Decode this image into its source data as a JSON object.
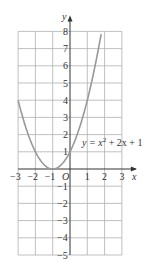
{
  "chart_data": {
    "type": "line",
    "title": "",
    "equation_label": "y = x² + 2x + 1",
    "equation_parts": {
      "lhs": "y = x",
      "sup": "2",
      "rhs": " + 2x + 1"
    },
    "xlabel": "x",
    "ylabel": "y",
    "origin_label": "O",
    "xlim": [
      -3,
      3
    ],
    "ylim": [
      -5,
      8
    ],
    "grid": true,
    "x_ticks": [
      "-3",
      "-2",
      "-1",
      "1",
      "2",
      "3"
    ],
    "y_ticks": [
      "8",
      "7",
      "6",
      "5",
      "4",
      "3",
      "2",
      "1",
      "-1",
      "-2",
      "-3",
      "-4",
      "-5"
    ],
    "series": [
      {
        "name": "y = x^2 + 2x + 1",
        "x": [
          -3,
          -2.5,
          -2,
          -1.5,
          -1,
          -0.5,
          0,
          0.5,
          1,
          1.5,
          1.83
        ],
        "y": [
          4,
          2.25,
          1,
          0.25,
          0,
          0.25,
          1,
          2.25,
          4,
          6.25,
          8
        ]
      }
    ],
    "colors": {
      "curve": "#999999",
      "grid": "#b0b0b0",
      "axis": "#333333"
    }
  }
}
